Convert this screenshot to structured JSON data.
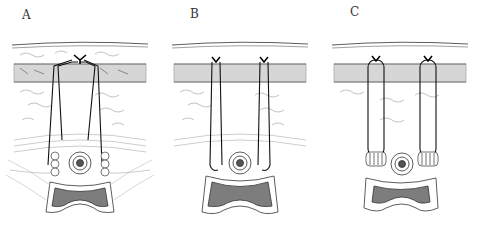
{
  "figure": {
    "panels": [
      {
        "label": "A",
        "suture_style": "central-knot-cluster",
        "label_pos": [
          22,
          8
        ]
      },
      {
        "label": "B",
        "suture_style": "two-separate-knots-flank",
        "label_pos": [
          190,
          7
        ]
      },
      {
        "label": "C",
        "suture_style": "two-knots-with-bolsters",
        "label_pos": [
          350,
          5
        ]
      }
    ],
    "colors": {
      "line": "#1a1a1a",
      "tissue_sketch": "#8a8a8a",
      "muscle_fill": "#9a9a9a",
      "lumen_fill": "#7d7d7d",
      "background": "#ffffff"
    }
  }
}
